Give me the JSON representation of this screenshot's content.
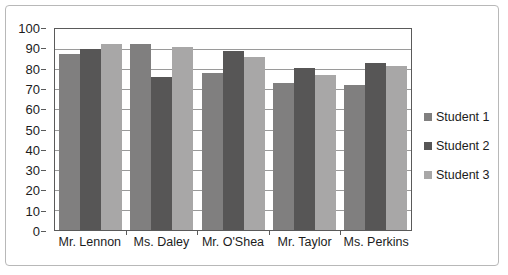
{
  "chart_data": {
    "type": "bar",
    "title": "",
    "xlabel": "",
    "ylabel": "",
    "ylim": [
      0,
      100
    ],
    "y_ticks": [
      0,
      10,
      20,
      30,
      40,
      50,
      60,
      70,
      80,
      90,
      100
    ],
    "grid": true,
    "legend_position": "right",
    "categories": [
      "Mr. Lennon",
      "Ms. Daley",
      "Mr. O'Shea",
      "Mr. Taylor",
      "Ms. Perkins"
    ],
    "series": [
      {
        "name": "Student 1",
        "color": "#807f7f",
        "values": [
          87.5,
          92.5,
          78,
          73,
          72
        ]
      },
      {
        "name": "Student 2",
        "color": "#575656",
        "values": [
          90,
          76,
          89,
          80.5,
          83
        ]
      },
      {
        "name": "Student 3",
        "color": "#a8a7a7",
        "values": [
          92.5,
          91,
          86,
          77,
          81.5
        ]
      }
    ]
  },
  "colors": {
    "frame_border": "#b8b8b8",
    "axis_line": "#5a5a5a",
    "gridline": "#9a9a9a",
    "text": "#1c1c1c",
    "background": "#ffffff"
  }
}
